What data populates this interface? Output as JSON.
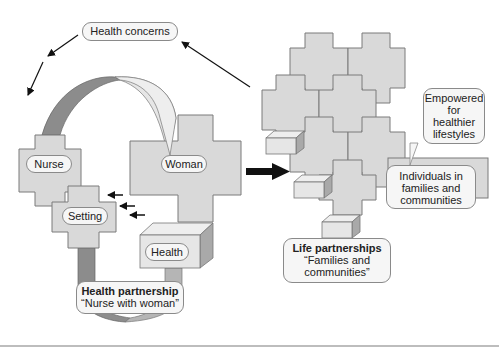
{
  "diagram": {
    "top_label": "Health concerns",
    "left_group": {
      "nurse": "Nurse",
      "setting": "Setting",
      "woman": "Woman",
      "health": "Health",
      "partnership_title": "Health partnership",
      "partnership_subtitle": "“Nurse with woman”"
    },
    "right_group": {
      "empowered": [
        "Empowered",
        "for",
        "healthier",
        "lifestyles"
      ],
      "individuals": [
        "Individuals in",
        "families and",
        "communities"
      ],
      "life_title": "Life partnerships",
      "life_subtitle": [
        "“Families and",
        "communities”"
      ]
    },
    "colors": {
      "cross_fill": "#d9d9d9",
      "cross_stroke": "#7a7a7a",
      "ribbon_dark": "#8c8c8c",
      "ribbon_light": "#e6e6e6",
      "arrow": "#111111"
    }
  }
}
